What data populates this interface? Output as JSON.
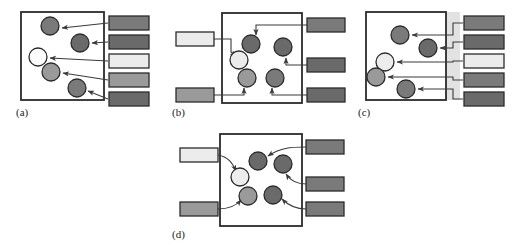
{
  "figure": {
    "background": "#ffffff",
    "stroke": "#2b2b2b",
    "arrow_color": "#3a3a3a",
    "palette": {
      "white": "#fcfcfc",
      "very_light": "#ececec",
      "light_gray": "#b8b8b8",
      "mid_gray": "#9a9a9a",
      "dark_gray": "#7a7a7a",
      "darker_gray": "#6a6a6a",
      "band_gray": "#e2e2e2"
    }
  },
  "panels": [
    {
      "id": "a",
      "caption": "(a)",
      "box": {
        "x": 21,
        "y": 12,
        "w": 83,
        "h": 88,
        "fill": "#ffffff"
      },
      "band": null,
      "nodes": [
        {
          "name": "node-a1",
          "cx": 50,
          "cy": 26,
          "r": 9,
          "fill": "#7a7a7a"
        },
        {
          "name": "node-a2",
          "cx": 80,
          "cy": 43,
          "r": 9,
          "fill": "#6a6a6a"
        },
        {
          "name": "node-a3",
          "cx": 38,
          "cy": 57,
          "r": 9,
          "fill": "#fcfcfc"
        },
        {
          "name": "node-a4",
          "cx": 51,
          "cy": 72,
          "r": 9,
          "fill": "#9a9a9a"
        },
        {
          "name": "node-a5",
          "cx": 77,
          "cy": 88,
          "r": 9,
          "fill": "#7a7a7a"
        }
      ],
      "ports_right": [
        {
          "name": "port-a1",
          "x": 109,
          "y": 16,
          "w": 40,
          "h": 14,
          "fill": "#7a7a7a"
        },
        {
          "name": "port-a2",
          "x": 109,
          "y": 35,
          "w": 40,
          "h": 14,
          "fill": "#6a6a6a"
        },
        {
          "name": "port-a3",
          "x": 109,
          "y": 54,
          "w": 40,
          "h": 14,
          "fill": "#ececec"
        },
        {
          "name": "port-a4",
          "x": 109,
          "y": 73,
          "w": 40,
          "h": 14,
          "fill": "#9a9a9a"
        },
        {
          "name": "port-a5",
          "x": 109,
          "y": 92,
          "w": 40,
          "h": 14,
          "fill": "#6a6a6a"
        }
      ],
      "ports_left": [],
      "arrows": [
        {
          "name": "arrow-a1",
          "d": "M 108 23 L 62 28",
          "head": "end"
        },
        {
          "name": "arrow-a2",
          "d": "M 108 42 L 92 43",
          "head": "end"
        },
        {
          "name": "arrow-a3",
          "d": "M 108 61 L 50 58",
          "head": "end"
        },
        {
          "name": "arrow-a4",
          "d": "M 108 80 L 63 73",
          "head": "end"
        },
        {
          "name": "arrow-a5",
          "d": "M 108 99 L 88 91",
          "head": "end"
        }
      ]
    },
    {
      "id": "b",
      "caption": "(b)",
      "box": {
        "x": 222,
        "y": 13,
        "w": 80,
        "h": 90,
        "fill": "#ffffff"
      },
      "band": null,
      "nodes": [
        {
          "name": "node-b1",
          "cx": 251,
          "cy": 44,
          "r": 9,
          "fill": "#6a6a6a"
        },
        {
          "name": "node-b2",
          "cx": 283,
          "cy": 47,
          "r": 9,
          "fill": "#6a6a6a"
        },
        {
          "name": "node-b3",
          "cx": 239,
          "cy": 60,
          "r": 9,
          "fill": "#ececec"
        },
        {
          "name": "node-b4",
          "cx": 247,
          "cy": 78,
          "r": 9,
          "fill": "#9a9a9a"
        },
        {
          "name": "node-b5",
          "cx": 275,
          "cy": 78,
          "r": 9,
          "fill": "#7a7a7a"
        }
      ],
      "ports_right": [
        {
          "name": "port-b-r1",
          "x": 307,
          "y": 18,
          "w": 38,
          "h": 14,
          "fill": "#7a7a7a"
        },
        {
          "name": "port-b-r2",
          "x": 307,
          "y": 58,
          "w": 38,
          "h": 14,
          "fill": "#6a6a6a"
        },
        {
          "name": "port-b-r3",
          "x": 307,
          "y": 88,
          "w": 38,
          "h": 14,
          "fill": "#6a6a6a"
        }
      ],
      "ports_left": [
        {
          "name": "port-b-l1",
          "x": 176,
          "y": 32,
          "w": 38,
          "h": 14,
          "fill": "#ececec"
        },
        {
          "name": "port-b-l2",
          "x": 176,
          "y": 88,
          "w": 38,
          "h": 14,
          "fill": "#9a9a9a"
        }
      ],
      "arrows": [
        {
          "name": "arrow-b1",
          "d": "M 214 39 L 231 39 L 231 52 L 236 56",
          "head": "end"
        },
        {
          "name": "arrow-b2",
          "d": "M 307 25 L 256 25 L 256 35",
          "head": "end"
        },
        {
          "name": "arrow-b3",
          "d": "M 307 65 L 286 65 L 286 58",
          "head": "end"
        },
        {
          "name": "arrow-b4",
          "d": "M 214 95 L 244 95 L 244 88",
          "head": "end"
        },
        {
          "name": "arrow-b5",
          "d": "M 307 95 L 272 95 L 272 88",
          "head": "end"
        }
      ]
    },
    {
      "id": "c",
      "caption": "(c)",
      "box": {
        "x": 366,
        "y": 12,
        "w": 80,
        "h": 88,
        "fill": "#ffffff"
      },
      "band": {
        "name": "band-c",
        "x": 446,
        "y": 12,
        "w": 14,
        "h": 88,
        "fill": "#e2e2e2"
      },
      "nodes": [
        {
          "name": "node-c1",
          "cx": 400,
          "cy": 35,
          "r": 9,
          "fill": "#7a7a7a"
        },
        {
          "name": "node-c2",
          "cx": 428,
          "cy": 48,
          "r": 9,
          "fill": "#6a6a6a"
        },
        {
          "name": "node-c3",
          "cx": 385,
          "cy": 62,
          "r": 9,
          "fill": "#ececec"
        },
        {
          "name": "node-c4",
          "cx": 376,
          "cy": 77,
          "r": 9,
          "fill": "#9a9a9a"
        },
        {
          "name": "node-c5",
          "cx": 406,
          "cy": 89,
          "r": 9,
          "fill": "#7a7a7a"
        }
      ],
      "ports_right": [
        {
          "name": "port-c1",
          "x": 464,
          "y": 16,
          "w": 40,
          "h": 14,
          "fill": "#7a7a7a"
        },
        {
          "name": "port-c2",
          "x": 464,
          "y": 35,
          "w": 40,
          "h": 14,
          "fill": "#6a6a6a"
        },
        {
          "name": "port-c3",
          "x": 464,
          "y": 54,
          "w": 40,
          "h": 14,
          "fill": "#ececec"
        },
        {
          "name": "port-c4",
          "x": 464,
          "y": 73,
          "w": 40,
          "h": 14,
          "fill": "#7a7a7a"
        },
        {
          "name": "port-c5",
          "x": 464,
          "y": 92,
          "w": 40,
          "h": 14,
          "fill": "#6a6a6a"
        }
      ],
      "ports_left": [],
      "arrows": [
        {
          "name": "arrow-c1",
          "d": "M 463 23 L 453 23 L 453 35 L 412 35",
          "head": "end"
        },
        {
          "name": "arrow-c2",
          "d": "M 463 42 L 453 42 L 453 48 L 440 48",
          "head": "end"
        },
        {
          "name": "arrow-c3",
          "d": "M 463 61 L 453 61 L 453 62 L 397 62",
          "head": "end"
        },
        {
          "name": "arrow-c4",
          "d": "M 463 80 L 453 80 L 453 77 L 388 77",
          "head": "end"
        },
        {
          "name": "arrow-c5",
          "d": "M 463 99 L 453 99 L 453 89 L 418 89",
          "head": "end"
        }
      ]
    },
    {
      "id": "d",
      "caption": "(d)",
      "box": {
        "x": 220,
        "y": 134,
        "w": 82,
        "h": 92,
        "fill": "#ffffff"
      },
      "band": null,
      "nodes": [
        {
          "name": "node-d1",
          "cx": 258,
          "cy": 161,
          "r": 9,
          "fill": "#6a6a6a"
        },
        {
          "name": "node-d2",
          "cx": 283,
          "cy": 164,
          "r": 9,
          "fill": "#6a6a6a"
        },
        {
          "name": "node-d3",
          "cx": 240,
          "cy": 177,
          "r": 9,
          "fill": "#ececec"
        },
        {
          "name": "node-d4",
          "cx": 248,
          "cy": 196,
          "r": 9,
          "fill": "#9a9a9a"
        },
        {
          "name": "node-d5",
          "cx": 273,
          "cy": 195,
          "r": 9,
          "fill": "#6a6a6a"
        }
      ],
      "ports_right": [
        {
          "name": "port-d-r1",
          "x": 306,
          "y": 140,
          "w": 38,
          "h": 14,
          "fill": "#7a7a7a"
        },
        {
          "name": "port-d-r2",
          "x": 306,
          "y": 177,
          "w": 38,
          "h": 14,
          "fill": "#7a7a7a"
        },
        {
          "name": "port-d-r3",
          "x": 306,
          "y": 202,
          "w": 38,
          "h": 14,
          "fill": "#7a7a7a"
        }
      ],
      "ports_left": [
        {
          "name": "port-d-l1",
          "x": 180,
          "y": 148,
          "w": 38,
          "h": 14,
          "fill": "#ececec"
        },
        {
          "name": "port-d-l2",
          "x": 180,
          "y": 202,
          "w": 38,
          "h": 14,
          "fill": "#9a9a9a"
        }
      ],
      "arrows": [
        {
          "name": "arrow-d1",
          "d": "M 218 155 C 228 157 232 162 236 171",
          "head": "end"
        },
        {
          "name": "arrow-d2",
          "d": "M 306 147 C 290 147 280 148 268 156",
          "head": "end"
        },
        {
          "name": "arrow-d3",
          "d": "M 306 184 C 296 184 290 180 286 174",
          "head": "end"
        },
        {
          "name": "arrow-d4",
          "d": "M 218 209 C 230 209 236 206 241 200",
          "head": "end"
        },
        {
          "name": "arrow-d5",
          "d": "M 306 209 C 295 209 288 205 282 199",
          "head": "end"
        }
      ]
    }
  ]
}
